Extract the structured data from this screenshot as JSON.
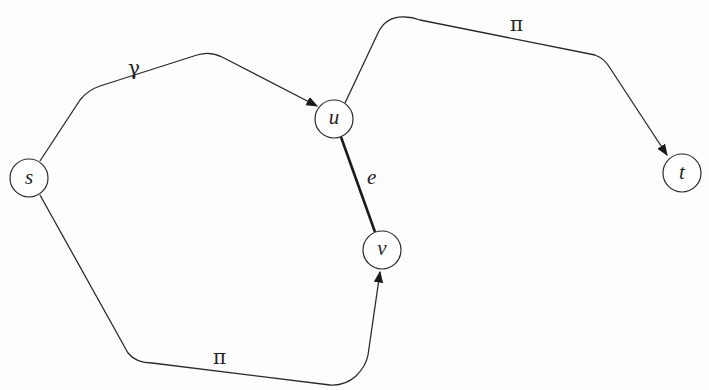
{
  "diagram": {
    "type": "graph",
    "nodes": [
      {
        "id": "s",
        "label": "s",
        "cx": 29,
        "cy": 178
      },
      {
        "id": "u",
        "label": "u",
        "cx": 334,
        "cy": 119
      },
      {
        "id": "v",
        "label": "v",
        "cx": 382,
        "cy": 250
      },
      {
        "id": "t",
        "label": "t",
        "cx": 682,
        "cy": 173
      }
    ],
    "edges": [
      {
        "id": "gamma",
        "from": "s",
        "to": "u",
        "label": "γ",
        "directed": true
      },
      {
        "id": "pi-upper",
        "from": "u",
        "to": "t",
        "label": "π",
        "directed": true
      },
      {
        "id": "e",
        "from": "u",
        "to": "v",
        "label": "e",
        "directed": false,
        "bold": true
      },
      {
        "id": "pi-lower",
        "from": "s",
        "to": "v",
        "label": "π",
        "directed": true
      }
    ],
    "colors": {
      "stroke": "#2a2a2a",
      "background": "#ffffff"
    }
  }
}
